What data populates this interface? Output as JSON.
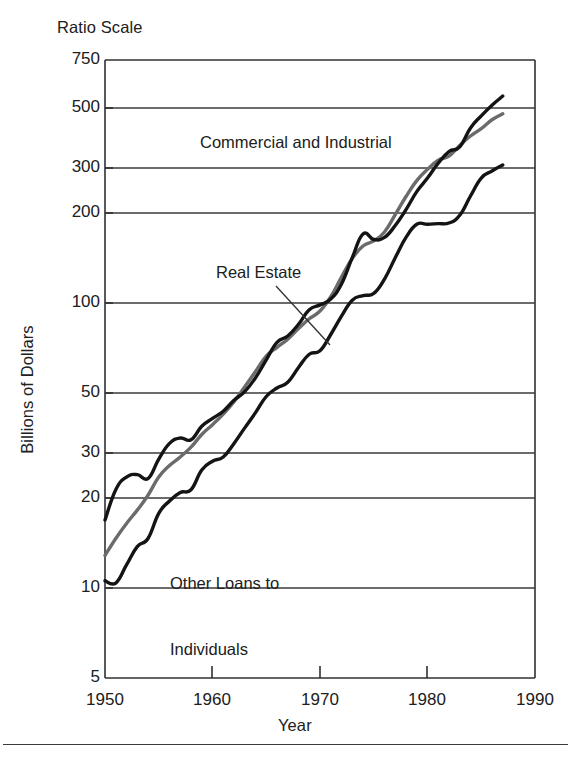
{
  "figure": {
    "ratio_scale_note": "Ratio Scale",
    "footer_rule": true
  },
  "chart_data": {
    "type": "line",
    "title": "",
    "subtitle": "Ratio Scale",
    "xlabel": "Year",
    "ylabel": "Billions of Dollars",
    "yscale": "log",
    "xscale": "linear",
    "grid": true,
    "grid_axis": "y",
    "legend_position": "inline-annotations",
    "xlim": [
      1950,
      1990
    ],
    "ylim": [
      5,
      750
    ],
    "xticks": [
      1950,
      1960,
      1970,
      1980,
      1990
    ],
    "xtick_labels": [
      "1950",
      "1960",
      "1970",
      "1980",
      "1990"
    ],
    "yticks": [
      5,
      10,
      20,
      30,
      50,
      100,
      200,
      300,
      500,
      750
    ],
    "ytick_labels": [
      "5",
      "10",
      "20",
      "30",
      "50",
      "100",
      "200",
      "300",
      "500",
      "750"
    ],
    "x": [
      1950,
      1951,
      1952,
      1953,
      1954,
      1955,
      1956,
      1957,
      1958,
      1959,
      1960,
      1961,
      1962,
      1963,
      1964,
      1965,
      1966,
      1967,
      1968,
      1969,
      1970,
      1971,
      1972,
      1973,
      1974,
      1975,
      1976,
      1977,
      1978,
      1979,
      1980,
      1981,
      1982,
      1983,
      1984,
      1985,
      1986,
      1987
    ],
    "series": [
      {
        "name": "Commercial and Industrial",
        "color": "#141414",
        "linewidth": 3.4,
        "values": [
          18.0,
          23.0,
          25.5,
          26.0,
          25.2,
          29.5,
          33.5,
          35.0,
          34.5,
          38.5,
          41.0,
          43.5,
          47.5,
          51.0,
          57.0,
          66.0,
          76.0,
          80.0,
          88.0,
          99.0,
          103.0,
          108.0,
          122.0,
          151.0,
          183.0,
          175.0,
          178.0,
          196.0,
          223.0,
          258.0,
          288.0,
          325.0,
          357.0,
          371.0,
          432.0,
          477.0,
          520.0,
          560.0
        ]
      },
      {
        "name": "Real Estate",
        "color": "#6b6b6b",
        "linewidth": 3.4,
        "values": [
          13.5,
          15.5,
          17.5,
          19.5,
          22.0,
          25.5,
          28.0,
          30.0,
          32.5,
          36.0,
          39.0,
          42.5,
          47.0,
          53.0,
          60.0,
          68.0,
          73.0,
          78.0,
          85.0,
          92.0,
          98.0,
          110.0,
          129.0,
          150.0,
          166.0,
          173.0,
          186.0,
          214.0,
          248.0,
          282.0,
          309.0,
          333.0,
          344.0,
          375.0,
          405.0,
          430.0,
          462.0,
          485.0
        ]
      },
      {
        "name": "Other Loans to Individuals",
        "color": "#141414",
        "linewidth": 3.4,
        "values": [
          11.0,
          10.8,
          12.5,
          14.5,
          15.5,
          19.0,
          21.0,
          22.5,
          23.0,
          27.0,
          29.0,
          30.0,
          33.5,
          38.0,
          43.0,
          49.0,
          52.5,
          55.0,
          62.0,
          69.0,
          71.0,
          81.0,
          94.0,
          107.0,
          111.0,
          113.0,
          127.0,
          151.0,
          178.0,
          198.0,
          198.0,
          199.0,
          200.0,
          213.0,
          249.0,
          288.0,
          305.0,
          320.0
        ]
      }
    ],
    "annotations": [
      {
        "id": "commercial-industrial",
        "text": "Commercial and Industrial",
        "x_px": 200,
        "y_px": 133
      },
      {
        "id": "real-estate",
        "text": "Real Estate",
        "x_px": 216,
        "y_px": 263,
        "leader": true
      },
      {
        "id": "other-loans",
        "line1": "Other Loans to",
        "line2": "Individuals",
        "x_px": 170,
        "y_px": 528
      }
    ]
  }
}
